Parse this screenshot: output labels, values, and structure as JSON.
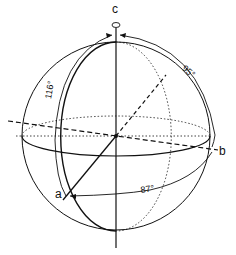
{
  "diagram": {
    "type": "crystallographic-axes-sphere",
    "axes": {
      "c": "c",
      "a": "a",
      "b": "b"
    },
    "angles": {
      "beta": "116°",
      "gamma": "95°",
      "alpha": "87°"
    },
    "colors": {
      "line": "#111111",
      "background": "#ffffff"
    }
  }
}
